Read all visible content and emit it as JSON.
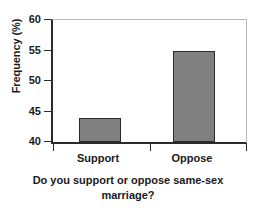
{
  "chart_data": {
    "type": "bar",
    "title": "",
    "categories": [
      "Support",
      "Oppose"
    ],
    "values": [
      44,
      55
    ],
    "xlabel": "Do you support or oppose same-sex marriage?",
    "xlabel_line1": "Do you support or oppose same-sex",
    "xlabel_line2": "marriage?",
    "ylabel": "Frequency (%)",
    "ylim": [
      40,
      60
    ],
    "yticks": [
      40,
      45,
      50,
      55,
      60
    ],
    "ytick_labels": [
      "40",
      "45",
      "50",
      "55",
      "60"
    ],
    "grid": false,
    "legend": false,
    "series": [
      {
        "name": "Frequency (%)",
        "values": [
          44,
          55
        ]
      }
    ],
    "colors": {
      "bar_fill": "#808080",
      "bar_border": "#2b2b2b",
      "axis": "#2b2b2b",
      "frame": "#b8b8b8",
      "text": "#1a1a1a",
      "background": "#ffffff"
    }
  }
}
